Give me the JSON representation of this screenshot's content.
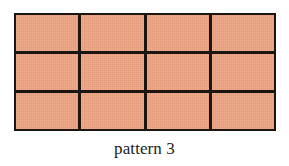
{
  "figure": {
    "caption": "pattern 3",
    "background_color": "#ffffff",
    "grid": {
      "rows": 3,
      "columns": 4,
      "cell_count": 12,
      "fill_color": "#eda381",
      "line_color": "#1c1613",
      "line_width_px": 3,
      "outer_border_width_px": 2,
      "cells": [
        {
          "row": 1,
          "column": 1,
          "label": ""
        },
        {
          "row": 1,
          "column": 2,
          "label": ""
        },
        {
          "row": 1,
          "column": 3,
          "label": ""
        },
        {
          "row": 1,
          "column": 4,
          "label": ""
        },
        {
          "row": 2,
          "column": 1,
          "label": ""
        },
        {
          "row": 2,
          "column": 2,
          "label": ""
        },
        {
          "row": 2,
          "column": 3,
          "label": ""
        },
        {
          "row": 2,
          "column": 4,
          "label": ""
        },
        {
          "row": 3,
          "column": 1,
          "label": ""
        },
        {
          "row": 3,
          "column": 2,
          "label": ""
        },
        {
          "row": 3,
          "column": 3,
          "label": ""
        },
        {
          "row": 3,
          "column": 4,
          "label": ""
        }
      ]
    }
  }
}
